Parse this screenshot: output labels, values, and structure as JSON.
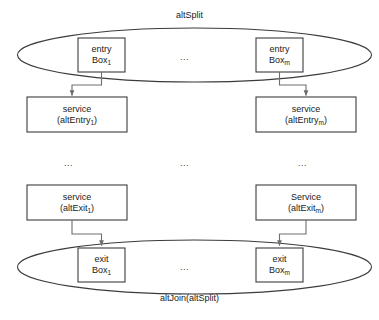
{
  "diagram": {
    "title": "altSplit",
    "bottom_title": "altJoin(altSplit)",
    "containers": [
      {
        "name": "altSplit-ellipse",
        "label": "altSplit",
        "position": "top"
      },
      {
        "name": "altJoin-ellipse",
        "label": "altJoin(altSplit)",
        "position": "bottom"
      }
    ],
    "boxes": [
      {
        "id": "entry-box-1",
        "line1": "entry",
        "line2": "Box",
        "sub": "1",
        "paren": false
      },
      {
        "id": "entry-box-m",
        "line1": "entry",
        "line2": "Box",
        "sub": "m",
        "paren": false
      },
      {
        "id": "service-altentry-1",
        "line1": "service",
        "line2": "altEntry",
        "sub": "1",
        "paren": true
      },
      {
        "id": "service-altentry-m",
        "line1": "service",
        "line2": "altEntry",
        "sub": "m",
        "paren": true
      },
      {
        "id": "service-altexit-1",
        "line1": "service",
        "line2": "altExit",
        "sub": "1",
        "paren": true
      },
      {
        "id": "service-altexit-m",
        "line1": "Service",
        "line2": "altExit",
        "sub": "m",
        "paren": true
      },
      {
        "id": "exit-box-1",
        "line1": "exit",
        "line2": "Box",
        "sub": "1",
        "paren": false
      },
      {
        "id": "exit-box-m",
        "line1": "exit",
        "line2": "Box",
        "sub": "m",
        "paren": false
      }
    ],
    "ellipses_marks": [
      {
        "id": "ellipsis-entry-row",
        "text": "..."
      },
      {
        "id": "ellipsis-middle-left",
        "text": "..."
      },
      {
        "id": "ellipsis-middle-center",
        "text": "..."
      },
      {
        "id": "ellipsis-middle-right",
        "text": "..."
      },
      {
        "id": "ellipsis-exit-row",
        "text": "..."
      }
    ],
    "colors": {
      "stroke": "#3c3c3c",
      "connector": "#6e6e6e",
      "text": "#1a1a1a",
      "background": "#ffffff"
    }
  }
}
